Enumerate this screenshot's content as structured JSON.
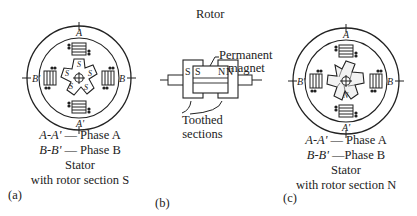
{
  "panels": {
    "a": {
      "tag": "(a)",
      "pole_labels": {
        "top": "A",
        "bottom": "A'",
        "left": "B'",
        "right": "B"
      },
      "rotor_tooth_label": "S",
      "legend": [
        {
          "key": "A-A'",
          "sep": " — ",
          "value": "Phase A"
        },
        {
          "key": "B-B'",
          "sep": " — ",
          "value": "Phase B"
        }
      ],
      "caption_line1": "Stator",
      "caption_line2": "with rotor section S"
    },
    "b": {
      "tag": "(b)",
      "title": "Rotor",
      "magnet_label_line1": "Permanent",
      "magnet_label_line2": "magnet",
      "pole_letters": [
        "S",
        "S",
        "N",
        "N"
      ],
      "sections_label_line1": "Toothed",
      "sections_label_line2": "sections"
    },
    "c": {
      "tag": "(c)",
      "pole_labels": {
        "top": "A",
        "bottom": "A'",
        "left": "B'",
        "right": "B"
      },
      "rotor_tooth_label": "N",
      "legend": [
        {
          "key": "A-A'",
          "sep": " — ",
          "value": "Phase A"
        },
        {
          "key": "B-B'",
          "sep": " —",
          "value": "Phase B"
        }
      ],
      "caption_line1": "Stator",
      "caption_line2": "with rotor section N"
    }
  }
}
